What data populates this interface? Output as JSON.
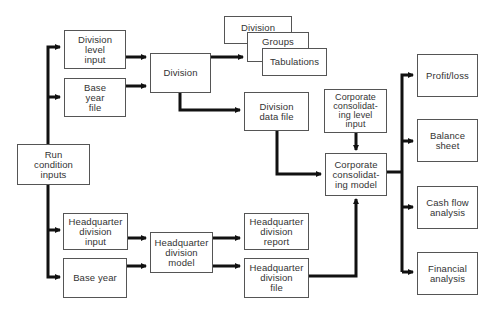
{
  "diagram": {
    "type": "flowchart",
    "nodes": {
      "run_condition_inputs": "Run\ncondition\ninputs",
      "division_level_input": "Division\nlevel\ninput",
      "base_year_file": "Base\nyear\nfile",
      "division": "Division",
      "report_division": "Division",
      "report_groups": "Groups",
      "report_tabulations": "Tabulations",
      "division_data_file": "Division\ndata file",
      "corporate_level_input": "Corporate\nconsolidat-\ning level\ninput",
      "corporate_model": "Corporate\nconsolidat-\ning model",
      "hq_division_input": "Headquarter\ndivision\ninput",
      "base_year": "Base year",
      "hq_division_model": "Headquarter\ndivision\nmodel",
      "hq_division_report": "Headquarter\ndivision\nreport",
      "hq_division_file": "Headquarter\ndivision\nfile",
      "profit_loss": "Profit/loss",
      "balance_sheet": "Balance\nsheet",
      "cash_flow_analysis": "Cash flow\nanalysis",
      "financial_analysis": "Financial\nanalysis"
    },
    "edges": [
      [
        "Run condition inputs",
        "Division level input"
      ],
      [
        "Run condition inputs",
        "Base year file"
      ],
      [
        "Run condition inputs",
        "Headquarter division input"
      ],
      [
        "Run condition inputs",
        "Base year"
      ],
      [
        "Division level input",
        "Division"
      ],
      [
        "Base year file",
        "Division"
      ],
      [
        "Division",
        "Division / Groups / Tabulations"
      ],
      [
        "Division",
        "Division data file"
      ],
      [
        "Division data file",
        "Corporate consolidating model"
      ],
      [
        "Corporate consolidating level input",
        "Corporate consolidating model"
      ],
      [
        "Headquarter division input",
        "Headquarter division model"
      ],
      [
        "Base year",
        "Headquarter division model"
      ],
      [
        "Headquarter division model",
        "Headquarter division report"
      ],
      [
        "Headquarter division model",
        "Headquarter division file"
      ],
      [
        "Headquarter division file",
        "Corporate consolidating model"
      ],
      [
        "Corporate consolidating model",
        "Profit/loss"
      ],
      [
        "Corporate consolidating model",
        "Balance sheet"
      ],
      [
        "Corporate consolidating model",
        "Cash flow analysis"
      ],
      [
        "Corporate consolidating model",
        "Financial analysis"
      ]
    ],
    "colors": {
      "line": "#111111",
      "border": "#555555",
      "text": "#333333",
      "background": "#ffffff"
    }
  }
}
